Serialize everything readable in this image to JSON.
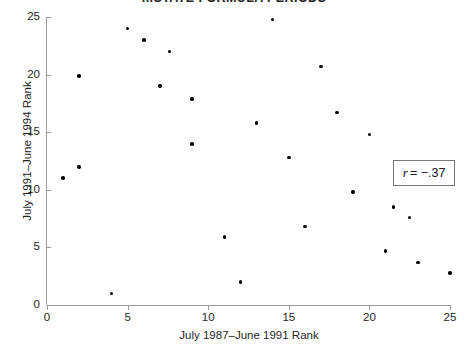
{
  "chart_data": {
    "type": "scatter",
    "title": "...STATE FORMULA PERIODS",
    "xlabel": "July 1987–June 1991 Rank",
    "ylabel": "July 1991–June 1994 Rank",
    "xlim": [
      0,
      25
    ],
    "ylim": [
      0,
      25
    ],
    "xticks": [
      0,
      5,
      10,
      15,
      20,
      25
    ],
    "yticks": [
      0,
      5,
      10,
      15,
      20,
      25
    ],
    "grid": false,
    "legend": "none",
    "annotations": [
      {
        "name": "correlation-coefficient",
        "symbol": "r",
        "equals": "= −.37",
        "text": "r = −.37",
        "value": -0.37
      }
    ],
    "marker": {
      "shape": "circle",
      "color": "#000000",
      "size": 3.6
    },
    "points": [
      {
        "x": 1,
        "y": 11.0
      },
      {
        "x": 2,
        "y": 12.0
      },
      {
        "x": 2,
        "y": 19.9
      },
      {
        "x": 4,
        "y": 1.0
      },
      {
        "x": 5,
        "y": 24.0
      },
      {
        "x": 6,
        "y": 23.0
      },
      {
        "x": 7,
        "y": 19.0
      },
      {
        "x": 7.6,
        "y": 22.0
      },
      {
        "x": 9,
        "y": 17.9
      },
      {
        "x": 9,
        "y": 14.0
      },
      {
        "x": 11,
        "y": 5.9
      },
      {
        "x": 12,
        "y": 2.0
      },
      {
        "x": 13,
        "y": 15.8
      },
      {
        "x": 14,
        "y": 24.8
      },
      {
        "x": 15,
        "y": 12.8
      },
      {
        "x": 16,
        "y": 6.8
      },
      {
        "x": 17,
        "y": 20.7
      },
      {
        "x": 18,
        "y": 16.7
      },
      {
        "x": 19,
        "y": 9.8
      },
      {
        "x": 20,
        "y": 14.8
      },
      {
        "x": 21,
        "y": 4.7
      },
      {
        "x": 21.5,
        "y": 8.5
      },
      {
        "x": 22.5,
        "y": 7.6
      },
      {
        "x": 23,
        "y": 3.7
      },
      {
        "x": 25,
        "y": 2.8
      }
    ]
  }
}
